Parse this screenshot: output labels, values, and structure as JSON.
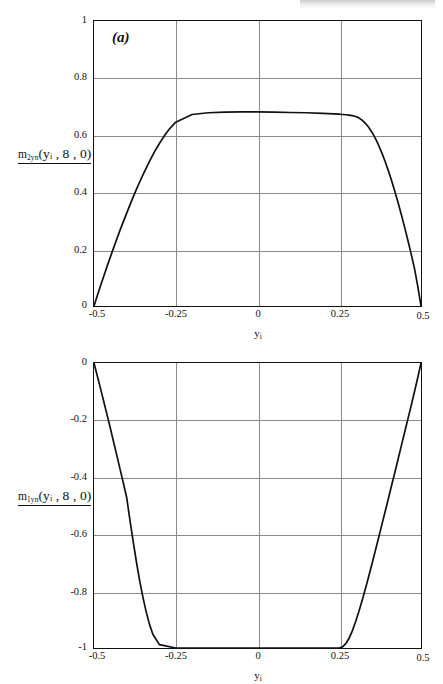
{
  "page": {
    "background": "#ffffff",
    "curve_color": "#111111",
    "grid_color": "#8a8a8a",
    "axis_color": "#111111"
  },
  "figures": [
    {
      "id": "a",
      "panel_label": "(a)",
      "y_axis_title_main": "m",
      "y_axis_title_sub": "2yn",
      "y_axis_title_args": "(yᵢ , 8 , 0)",
      "x_axis_title_main": "y",
      "x_axis_title_sub": "i",
      "x_ticks": [
        "-0.5",
        "-0.25",
        "0",
        "0.25",
        "0.5"
      ],
      "y_ticks": [
        "0",
        "0.2",
        "0.4",
        "0.6",
        "0.8",
        "1"
      ]
    },
    {
      "id": "b",
      "panel_label": "(b)",
      "y_axis_title_main": "m",
      "y_axis_title_sub": "1yn",
      "y_axis_title_args": "(yᵢ , 8 , 0)",
      "x_axis_title_main": "y",
      "x_axis_title_sub": "i",
      "x_ticks": [
        "-0.5",
        "-0.25",
        "0",
        "0.25",
        "0.5"
      ],
      "y_ticks": [
        "0",
        "-0.2",
        "-0.4",
        "-0.6",
        "-0.8",
        "-1"
      ]
    }
  ],
  "chart_data": [
    {
      "type": "line",
      "title": "(a)",
      "xlabel": "y_i",
      "ylabel": "m_2yn(y_i, 8, 0)",
      "xlim": [
        -0.5,
        0.5
      ],
      "ylim": [
        0,
        1
      ],
      "xticks": [
        -0.5,
        -0.25,
        0,
        0.25,
        0.5
      ],
      "yticks": [
        0,
        0.2,
        0.4,
        0.6,
        0.8,
        1
      ],
      "grid": true,
      "legend": "none",
      "plateau_value": 0.68,
      "series": [
        {
          "name": "m_2yn",
          "x": [
            -0.5,
            -0.49,
            -0.48,
            -0.47,
            -0.46,
            -0.45,
            -0.44,
            -0.43,
            -0.42,
            -0.41,
            -0.4,
            -0.39,
            -0.38,
            -0.37,
            -0.36,
            -0.35,
            -0.34,
            -0.33,
            -0.32,
            -0.31,
            -0.3,
            -0.29,
            -0.28,
            -0.27,
            -0.26,
            -0.25,
            -0.2,
            -0.15,
            -0.1,
            -0.05,
            0.0,
            0.05,
            0.1,
            0.15,
            0.2,
            0.25,
            0.26,
            0.27,
            0.28,
            0.29,
            0.3,
            0.31,
            0.32,
            0.33,
            0.34,
            0.35,
            0.36,
            0.37,
            0.38,
            0.39,
            0.4,
            0.41,
            0.42,
            0.43,
            0.44,
            0.45,
            0.46,
            0.47,
            0.48,
            0.49,
            0.5
          ],
          "y": [
            0.0,
            0.036,
            0.071,
            0.105,
            0.139,
            0.172,
            0.204,
            0.236,
            0.267,
            0.297,
            0.326,
            0.355,
            0.383,
            0.41,
            0.436,
            0.461,
            0.485,
            0.508,
            0.53,
            0.551,
            0.57,
            0.588,
            0.605,
            0.62,
            0.633,
            0.645,
            0.672,
            0.678,
            0.68,
            0.681,
            0.681,
            0.68,
            0.679,
            0.678,
            0.676,
            0.673,
            0.672,
            0.671,
            0.67,
            0.668,
            0.665,
            0.66,
            0.652,
            0.641,
            0.627,
            0.61,
            0.589,
            0.565,
            0.538,
            0.508,
            0.475,
            0.44,
            0.402,
            0.362,
            0.32,
            0.276,
            0.23,
            0.182,
            0.132,
            0.07,
            0.0
          ]
        }
      ]
    },
    {
      "type": "line",
      "title": "(b)",
      "xlabel": "y_i",
      "ylabel": "m_1yn(y_i, 8, 0)",
      "xlim": [
        -0.5,
        0.5
      ],
      "ylim": [
        -1,
        0
      ],
      "xticks": [
        -0.5,
        -0.25,
        0,
        0.25,
        0.5
      ],
      "yticks": [
        -1,
        -0.8,
        -0.6,
        -0.4,
        -0.2,
        0
      ],
      "grid": true,
      "legend": "none",
      "plateau_value": -1.0,
      "series": [
        {
          "name": "m_1yn",
          "x": [
            -0.5,
            -0.49,
            -0.48,
            -0.47,
            -0.46,
            -0.45,
            -0.44,
            -0.43,
            -0.42,
            -0.41,
            -0.4,
            -0.39,
            -0.38,
            -0.37,
            -0.36,
            -0.35,
            -0.34,
            -0.33,
            -0.32,
            -0.3,
            -0.25,
            -0.2,
            -0.1,
            0.0,
            0.1,
            0.2,
            0.24,
            0.25,
            0.26,
            0.27,
            0.28,
            0.29,
            0.3,
            0.31,
            0.32,
            0.33,
            0.34,
            0.35,
            0.36,
            0.37,
            0.38,
            0.39,
            0.4,
            0.41,
            0.42,
            0.43,
            0.44,
            0.45,
            0.46,
            0.47,
            0.48,
            0.49,
            0.5
          ],
          "y": [
            0.0,
            -0.045,
            -0.09,
            -0.136,
            -0.182,
            -0.229,
            -0.277,
            -0.325,
            -0.374,
            -0.423,
            -0.472,
            -0.552,
            -0.628,
            -0.7,
            -0.766,
            -0.824,
            -0.875,
            -0.918,
            -0.952,
            -0.988,
            -1.0,
            -1.0,
            -1.0,
            -1.0,
            -1.0,
            -1.0,
            -1.0,
            -1.0,
            -0.996,
            -0.985,
            -0.966,
            -0.94,
            -0.908,
            -0.872,
            -0.833,
            -0.792,
            -0.749,
            -0.705,
            -0.66,
            -0.615,
            -0.569,
            -0.523,
            -0.477,
            -0.43,
            -0.384,
            -0.337,
            -0.29,
            -0.243,
            -0.196,
            -0.149,
            -0.101,
            -0.052,
            0.0
          ]
        }
      ]
    }
  ]
}
